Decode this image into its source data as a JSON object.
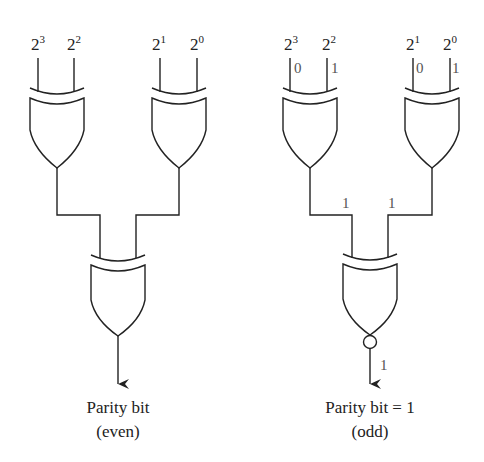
{
  "left_circuit": {
    "title": "Even parity generator",
    "inputs": [
      {
        "base": "2",
        "exp": "3"
      },
      {
        "base": "2",
        "exp": "2"
      },
      {
        "base": "2",
        "exp": "1"
      },
      {
        "base": "2",
        "exp": "0"
      }
    ],
    "gates": [
      "XOR",
      "XOR",
      "XOR"
    ],
    "output_label_line1": "Parity bit",
    "output_label_line2": "(even)"
  },
  "right_circuit": {
    "title": "Odd parity generator",
    "inputs": [
      {
        "base": "2",
        "exp": "3",
        "value": "0"
      },
      {
        "base": "2",
        "exp": "2",
        "value": "1"
      },
      {
        "base": "2",
        "exp": "1",
        "value": "0"
      },
      {
        "base": "2",
        "exp": "0",
        "value": "1"
      }
    ],
    "gates": [
      "XOR",
      "XOR",
      "XNOR"
    ],
    "intermediate_values": [
      "1",
      "1"
    ],
    "output_value": "1",
    "output_label_line1": "Parity bit = 1",
    "output_label_line2": "(odd)"
  }
}
